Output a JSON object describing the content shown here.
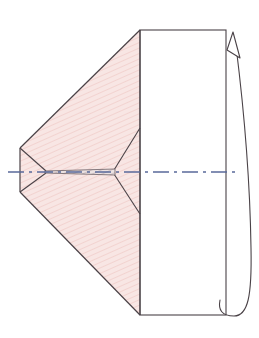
{
  "figure": {
    "background_color": "#ffffff",
    "canvas": {
      "width": 259,
      "height": 338
    },
    "colors": {
      "outline": "#4a4247",
      "cone_fill": "#f8e6e4",
      "hatch_line": "#f0cfcb",
      "cylinder_fill": "#ffffff",
      "axis_line": "#5a6a9a",
      "arrow_line": "#4a4247"
    },
    "shapes": {
      "cone_upper": {
        "name": "upper-cone-face",
        "points": "20,148 140,30 140,315 20,192 45,171"
      },
      "cone_body": {
        "name": "cone-body-polygon",
        "points": "20,148 140,30 140,315 20,192"
      },
      "cone_left_edge": {
        "name": "cone-left-edge",
        "x1": 20,
        "y1": 148,
        "x2": 20,
        "y2": 192
      },
      "cone_left_apex_upper": {
        "name": "cone-left-apex-upper-edge",
        "x1": 20,
        "y1": 148,
        "x2": 45,
        "y2": 171
      },
      "cone_left_apex_lower": {
        "name": "cone-left-apex-lower-edge",
        "x1": 20,
        "y1": 192,
        "x2": 45,
        "y2": 171
      },
      "cone_right_apex_upper": {
        "name": "cone-right-apex-upper-edge",
        "x1": 140,
        "y1": 128,
        "x2": 115,
        "y2": 172
      },
      "cone_right_apex_lower": {
        "name": "cone-right-apex-lower-edge",
        "x1": 140,
        "y1": 214,
        "x2": 115,
        "y2": 172
      },
      "shaft": {
        "name": "central-shaft-needle",
        "points": "45,171 115,169 115,175 45,173"
      },
      "cylinder": {
        "name": "cylinder-rectangle",
        "x": 140,
        "y": 30,
        "width": 86,
        "height": 285
      },
      "cylinder_right_divider": {
        "name": "cylinder-right-edge",
        "x1": 226,
        "y1": 30,
        "x2": 226,
        "y2": 315
      },
      "axis": {
        "name": "axis-centerline",
        "x1": 8,
        "y1": 172,
        "x2": 240,
        "y2": 172,
        "dash_pattern": "14 4 3 4"
      },
      "rotation_arc": {
        "name": "rotation-arrow-arc",
        "path": "M 232,316 C 248,316 252,300 251,250 C 250,180 244,110 236,46"
      },
      "rotation_arc_tail": {
        "name": "rotation-arrow-tail",
        "path": "M 232,316 C 222,316 220,310 222,302"
      },
      "arrow_head": {
        "name": "rotation-arrow-head",
        "points": "234,33 240,57 228,50"
      }
    }
  }
}
